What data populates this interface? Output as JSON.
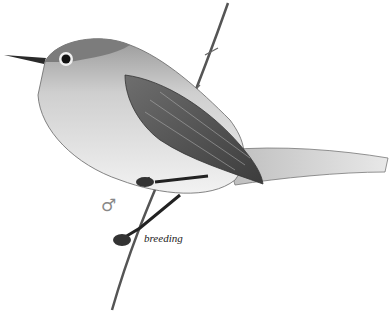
{
  "illustration": {
    "subject": "bird perched on thin branch",
    "sex_symbol": "♂",
    "caption": "breeding"
  }
}
